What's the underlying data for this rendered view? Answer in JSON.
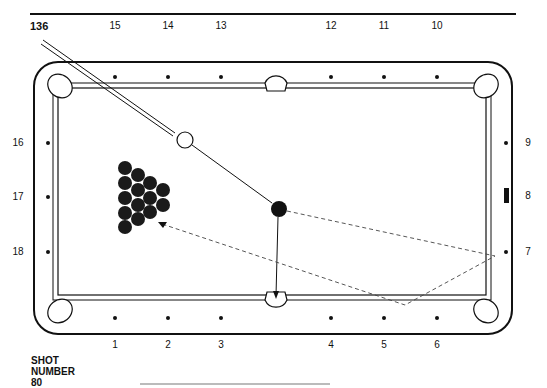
{
  "header": {
    "shot_id": "136"
  },
  "caption": {
    "line1": "SHOT",
    "line2": "NUMBER",
    "line3": "80"
  },
  "diamonds": {
    "bottom": [
      {
        "label": "1",
        "x": 115
      },
      {
        "label": "2",
        "x": 168
      },
      {
        "label": "3",
        "x": 221
      },
      {
        "label": "4",
        "x": 331
      },
      {
        "label": "5",
        "x": 384
      },
      {
        "label": "6",
        "x": 437
      }
    ],
    "right": [
      {
        "label": "7",
        "y": 252
      },
      {
        "label": "8",
        "y": 196
      },
      {
        "label": "9",
        "y": 143
      }
    ],
    "top": [
      {
        "label": "10",
        "x": 437
      },
      {
        "label": "11",
        "x": 384
      },
      {
        "label": "12",
        "x": 331
      },
      {
        "label": "13",
        "x": 221
      },
      {
        "label": "14",
        "x": 168
      },
      {
        "label": "15",
        "x": 115
      }
    ],
    "left": [
      {
        "label": "16",
        "y": 143
      },
      {
        "label": "17",
        "y": 197
      },
      {
        "label": "18",
        "y": 252
      }
    ]
  },
  "balls": {
    "cue_ball": {
      "x": 185,
      "y": 140,
      "r": 8
    },
    "object_ball": {
      "x": 279,
      "y": 209,
      "r": 8
    },
    "rack": {
      "rows": [
        5,
        4,
        3,
        2
      ],
      "ball_r": 7
    }
  },
  "paths": {
    "cue_to_object": "solid",
    "object_to_side_pocket": "solid with arrow",
    "object_bank_path": "dashed, banks off right rail near diamond 7 and bottom rail between 5 and 6, returns to rack"
  },
  "colors": {
    "ink": "#111111",
    "background": "#ffffff"
  }
}
